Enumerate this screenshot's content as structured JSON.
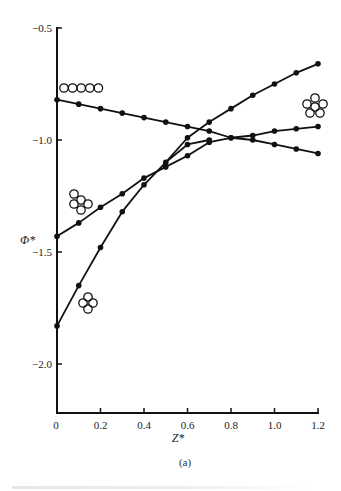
{
  "chart_data": {
    "type": "line",
    "title": "",
    "subtitle": "(a)",
    "xlabel": "Z*",
    "ylabel": "Φ*",
    "xlim": [
      0,
      1.2
    ],
    "ylim": [
      -2.2,
      -0.5
    ],
    "grid": false,
    "x_ticks": [
      0,
      0.2,
      0.4,
      0.6,
      0.8,
      1.0,
      1.2
    ],
    "x_tick_labels": [
      "0",
      "0.2",
      "0.4",
      "0.6",
      "0.8",
      "1.0",
      "1.2"
    ],
    "y_ticks": [
      -0.5,
      -1.0,
      -1.5,
      -2.0
    ],
    "y_tick_labels": [
      "-0.5",
      "-1.0",
      "-1.5",
      "-2.0"
    ],
    "series": [
      {
        "name": "linear-chain-cluster",
        "icon": "five-circles-in-row",
        "x": [
          0,
          0.1,
          0.2,
          0.3,
          0.4,
          0.5,
          0.6,
          0.7,
          0.8,
          0.9,
          1.0,
          1.1,
          1.2
        ],
        "values": [
          -0.82,
          -0.84,
          -0.86,
          -0.88,
          -0.9,
          -0.92,
          -0.94,
          -0.96,
          -0.99,
          -1.0,
          -1.02,
          -1.04,
          -1.06
        ]
      },
      {
        "name": "triangular-cluster",
        "icon": "four-circles-triangle",
        "x": [
          0,
          0.1,
          0.2,
          0.3,
          0.4,
          0.5,
          0.6,
          0.7,
          0.8,
          0.9,
          1.0,
          1.1,
          1.2
        ],
        "values": [
          -1.43,
          -1.37,
          -1.3,
          -1.24,
          -1.17,
          -1.12,
          -1.07,
          -1.01,
          -0.99,
          -0.98,
          -0.96,
          -0.95,
          -0.94
        ]
      },
      {
        "name": "cross-cluster",
        "icon": "four-circles-cross",
        "x": [
          0,
          0.1,
          0.2,
          0.3,
          0.4,
          0.5,
          0.6,
          0.7
        ],
        "values": [
          -1.83,
          -1.65,
          -1.48,
          -1.32,
          -1.2,
          -1.1,
          -1.02,
          -1.0
        ]
      },
      {
        "name": "compact-ring-cluster",
        "icon": "six-circles-ring",
        "x": [
          0.6,
          0.7,
          0.8,
          0.9,
          1.0,
          1.1,
          1.2
        ],
        "values": [
          -0.99,
          -0.92,
          -0.86,
          -0.8,
          -0.75,
          -0.7,
          -0.66
        ]
      }
    ],
    "annotations": [
      {
        "icon": "five-circles-in-row",
        "near_series": "linear-chain-cluster",
        "position": "top-left"
      },
      {
        "icon": "four-circles-triangle",
        "near_series": "triangular-cluster",
        "position": "left"
      },
      {
        "icon": "four-circles-cross",
        "near_series": "cross-cluster",
        "position": "bottom-left"
      },
      {
        "icon": "six-circles-ring",
        "near_series": "compact-ring-cluster",
        "position": "right"
      }
    ]
  }
}
